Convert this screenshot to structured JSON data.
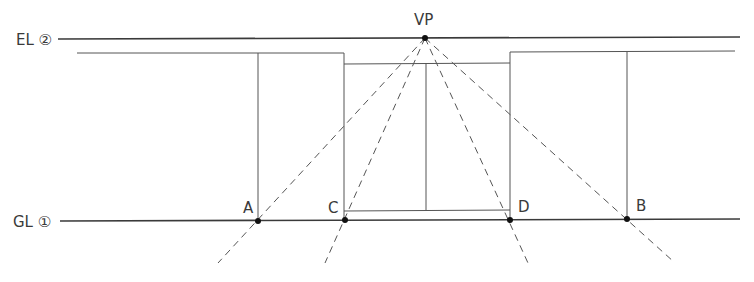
{
  "labels": {
    "eye_level": "EL ②",
    "ground_line": "GL ①",
    "vanishing_point": "VP",
    "point_a": "A",
    "point_b": "B",
    "point_c": "C",
    "point_d": "D"
  },
  "colors": {
    "line": "#3a3a3a",
    "thin_line": "#555555",
    "dash": "#555555"
  }
}
